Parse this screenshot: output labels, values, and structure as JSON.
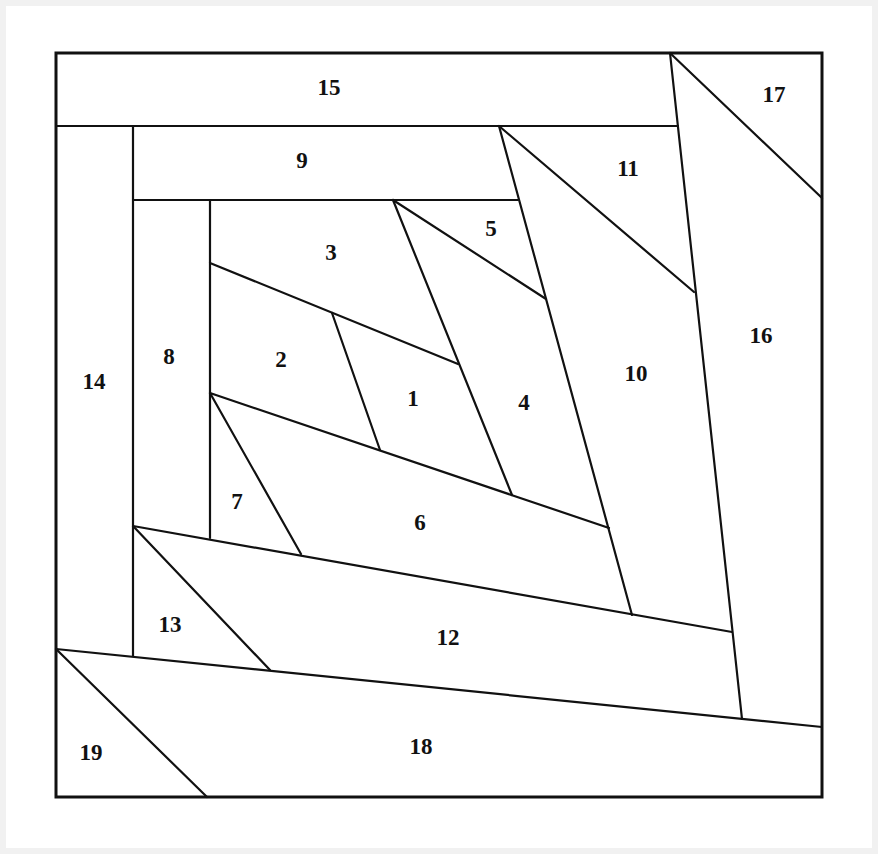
{
  "diagram": {
    "type": "foundation-paper-piecing-block",
    "stroke_color": "#111111",
    "fill_color": "#ffffff",
    "background_color": "#f1f1f1",
    "border": {
      "x1": 56,
      "y1": 53,
      "x2": 822,
      "y2": 797
    },
    "seam_lines": [
      {
        "x1": 56,
        "y1": 126,
        "x2": 678,
        "y2": 126
      },
      {
        "x1": 670,
        "y1": 53,
        "x2": 742,
        "y2": 719
      },
      {
        "x1": 670,
        "y1": 53,
        "x2": 822,
        "y2": 198
      },
      {
        "x1": 133,
        "y1": 126,
        "x2": 133,
        "y2": 656
      },
      {
        "x1": 133,
        "y1": 200,
        "x2": 518,
        "y2": 200
      },
      {
        "x1": 210,
        "y1": 200,
        "x2": 210,
        "y2": 538
      },
      {
        "x1": 499,
        "y1": 126,
        "x2": 694,
        "y2": 292
      },
      {
        "x1": 499,
        "y1": 126,
        "x2": 632,
        "y2": 615
      },
      {
        "x1": 393,
        "y1": 200,
        "x2": 546,
        "y2": 299
      },
      {
        "x1": 393,
        "y1": 200,
        "x2": 512,
        "y2": 495
      },
      {
        "x1": 210,
        "y1": 263,
        "x2": 458,
        "y2": 364
      },
      {
        "x1": 332,
        "y1": 313,
        "x2": 380,
        "y2": 450
      },
      {
        "x1": 210,
        "y1": 393,
        "x2": 609,
        "y2": 528
      },
      {
        "x1": 210,
        "y1": 393,
        "x2": 301,
        "y2": 554
      },
      {
        "x1": 133,
        "y1": 526,
        "x2": 732,
        "y2": 632
      },
      {
        "x1": 133,
        "y1": 526,
        "x2": 270,
        "y2": 670
      },
      {
        "x1": 56,
        "y1": 649,
        "x2": 822,
        "y2": 727
      },
      {
        "x1": 56,
        "y1": 649,
        "x2": 207,
        "y2": 797
      }
    ],
    "pieces": [
      {
        "label": "1",
        "x": 413,
        "y": 398
      },
      {
        "label": "2",
        "x": 281,
        "y": 359
      },
      {
        "label": "3",
        "x": 331,
        "y": 252
      },
      {
        "label": "4",
        "x": 524,
        "y": 402
      },
      {
        "label": "5",
        "x": 491,
        "y": 228
      },
      {
        "label": "6",
        "x": 420,
        "y": 522
      },
      {
        "label": "7",
        "x": 237,
        "y": 501
      },
      {
        "label": "8",
        "x": 169,
        "y": 356
      },
      {
        "label": "9",
        "x": 302,
        "y": 160
      },
      {
        "label": "10",
        "x": 636,
        "y": 373
      },
      {
        "label": "11",
        "x": 628,
        "y": 168
      },
      {
        "label": "12",
        "x": 448,
        "y": 637
      },
      {
        "label": "13",
        "x": 170,
        "y": 624
      },
      {
        "label": "14",
        "x": 94,
        "y": 381
      },
      {
        "label": "15",
        "x": 329,
        "y": 87
      },
      {
        "label": "16",
        "x": 761,
        "y": 335
      },
      {
        "label": "17",
        "x": 774,
        "y": 94
      },
      {
        "label": "18",
        "x": 421,
        "y": 746
      },
      {
        "label": "19",
        "x": 91,
        "y": 752
      }
    ]
  }
}
